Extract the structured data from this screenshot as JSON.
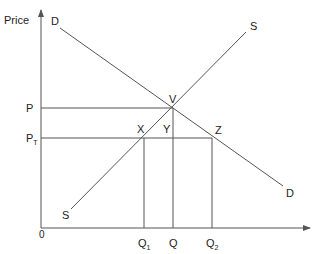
{
  "diagram": {
    "type": "supply-demand",
    "axes": {
      "y_label": "Price",
      "origin_label": "0"
    },
    "curves": {
      "demand_label_top": "D",
      "demand_label_bottom": "D",
      "supply_label_top": "S",
      "supply_label_bottom": "S"
    },
    "price_labels": {
      "p": "P",
      "pt_main": "P",
      "pt_sub": "T"
    },
    "quantity_labels": {
      "q1_main": "Q",
      "q1_sub": "1",
      "q": "Q",
      "q2_main": "Q",
      "q2_sub": "2"
    },
    "points": {
      "v": "V",
      "x": "X",
      "y": "Y",
      "z": "Z"
    }
  }
}
